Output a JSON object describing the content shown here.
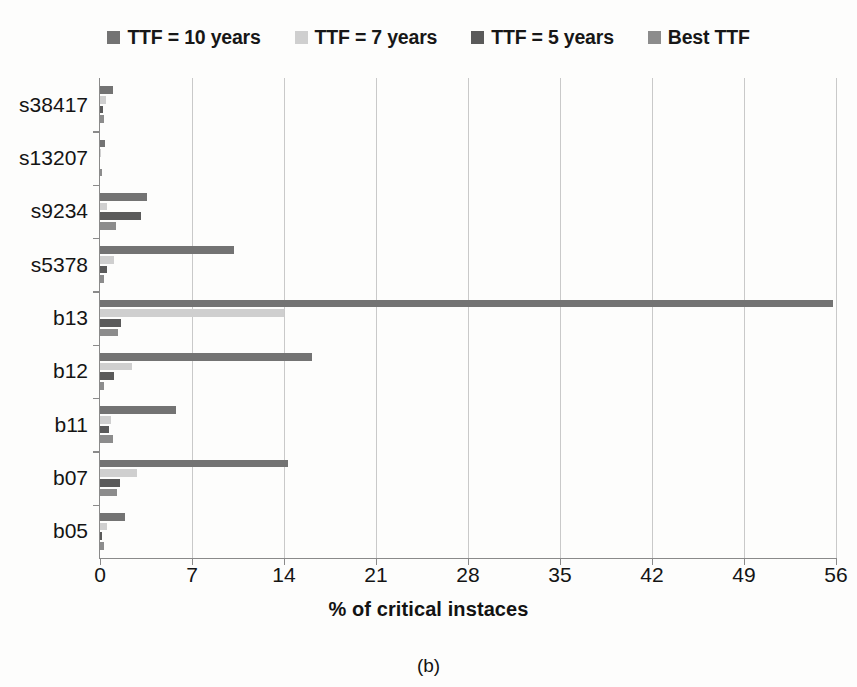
{
  "chart_data": {
    "type": "bar",
    "orientation": "horizontal",
    "title": "",
    "xlabel": "% of critical instaces",
    "ylabel": "",
    "xlim": [
      0,
      56
    ],
    "xticks": [
      0,
      7,
      14,
      21,
      28,
      35,
      42,
      49,
      56
    ],
    "grid": "vertical",
    "legend_position": "top",
    "categories": [
      "s38417",
      "s13207",
      "s9234",
      "s5378",
      "b13",
      "b12",
      "b11",
      "b07",
      "b05"
    ],
    "series": [
      {
        "name": "TTF = 10 years",
        "color": "#737373",
        "values": [
          1.0,
          0.35,
          3.6,
          10.2,
          55.8,
          16.1,
          5.8,
          14.3,
          1.9
        ]
      },
      {
        "name": "TTF = 7 years",
        "color": "#cfcfcf",
        "values": [
          0.45,
          0.1,
          0.55,
          1.1,
          14.0,
          2.4,
          0.8,
          2.8,
          0.5
        ]
      },
      {
        "name": "TTF = 5 years",
        "color": "#5a5a5a",
        "values": [
          0.2,
          0.0,
          3.1,
          0.5,
          1.6,
          1.1,
          0.7,
          1.5,
          0.15
        ]
      },
      {
        "name": "Best TTF",
        "color": "#8c8c8c",
        "values": [
          0.3,
          0.15,
          1.25,
          0.3,
          1.4,
          0.3,
          1.0,
          1.3,
          0.3
        ]
      }
    ]
  },
  "legend": {
    "items": [
      {
        "label": "TTF = 10 years",
        "swatch": "legend-swatch-ttf-10"
      },
      {
        "label": "TTF = 7 years",
        "swatch": "legend-swatch-ttf-7"
      },
      {
        "label": "TTF = 5 years",
        "swatch": "legend-swatch-ttf-5"
      },
      {
        "label": "Best TTF",
        "swatch": "legend-swatch-best-ttf"
      }
    ]
  },
  "axes": {
    "x_title": "% of critical instaces",
    "x_tick_labels": [
      "0",
      "7",
      "14",
      "21",
      "28",
      "35",
      "42",
      "49",
      "56"
    ],
    "y_tick_labels": [
      "s38417",
      "s13207",
      "s9234",
      "s5378",
      "b13",
      "b12",
      "b11",
      "b07",
      "b05"
    ]
  },
  "caption": "(b)"
}
